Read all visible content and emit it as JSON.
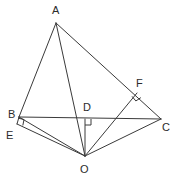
{
  "figure": {
    "type": "geometry-diagram",
    "width": 175,
    "height": 183,
    "background_color": "#ffffff",
    "stroke_color": "#3a3a3a",
    "label_color": "#2b2b2b"
  },
  "vertices": [
    {
      "id": "A",
      "label": "A",
      "x": 56,
      "y": 23,
      "label_x": 52,
      "label_y": 5
    },
    {
      "id": "B",
      "label": "B",
      "x": 19,
      "y": 117,
      "label_x": 8,
      "label_y": 109
    },
    {
      "id": "C",
      "label": "C",
      "x": 161,
      "y": 119,
      "label_x": 162,
      "label_y": 122
    },
    {
      "id": "D",
      "label": "D",
      "x": 85,
      "y": 119,
      "label_x": 83,
      "label_y": 102
    },
    {
      "id": "E",
      "label": "E",
      "x": 17,
      "y": 124,
      "label_x": 6,
      "label_y": 130
    },
    {
      "id": "F",
      "label": "F",
      "x": 137,
      "y": 93,
      "label_x": 136,
      "label_y": 78
    },
    {
      "id": "O",
      "label": "O",
      "x": 85,
      "y": 156,
      "label_x": 80,
      "label_y": 164
    }
  ],
  "segments": [
    {
      "name": "A-B",
      "from": "A",
      "to": "B"
    },
    {
      "name": "A-C",
      "from": "A",
      "to": "C"
    },
    {
      "name": "A-O",
      "from": "A",
      "to": "O"
    },
    {
      "name": "B-C",
      "from": "B",
      "to": "C"
    },
    {
      "name": "B-O",
      "from": "B",
      "to": "O"
    },
    {
      "name": "B-E",
      "from": "B",
      "to": "E"
    },
    {
      "name": "E-O",
      "from": "E",
      "to": "O"
    },
    {
      "name": "O-D",
      "from": "O",
      "to": "D"
    },
    {
      "name": "O-F",
      "from": "O",
      "to": "F"
    },
    {
      "name": "O-C",
      "from": "O",
      "to": "C"
    }
  ],
  "right_angle_marks": [
    {
      "name": "right-angle-at-D",
      "vertex": "D",
      "x": 85,
      "y": 119,
      "dir1": [
        0,
        1
      ],
      "dir2": [
        1,
        0
      ],
      "size": 6
    },
    {
      "name": "right-angle-at-E",
      "vertex": "E",
      "x": 17,
      "y": 124,
      "dir1": [
        0.97,
        0.24
      ],
      "dir2": [
        0.2,
        -0.98
      ],
      "size": 6
    },
    {
      "name": "right-angle-at-F",
      "vertex": "F",
      "x": 137,
      "y": 93,
      "dir1": [
        0.64,
        0.77
      ],
      "dir2": [
        -0.83,
        0.56
      ],
      "size": 6
    }
  ]
}
